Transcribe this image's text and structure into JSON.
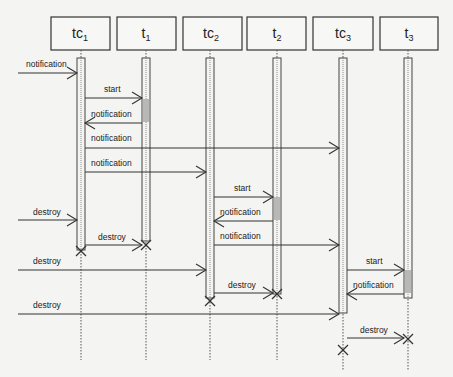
{
  "diagram": {
    "type": "sequence",
    "participants": [
      {
        "id": "tc1",
        "base": "tc",
        "sub": "1",
        "x": 81
      },
      {
        "id": "t1",
        "base": "t",
        "sub": "1",
        "x": 146
      },
      {
        "id": "tc2",
        "base": "tc",
        "sub": "2",
        "x": 210
      },
      {
        "id": "t2",
        "base": "t",
        "sub": "2",
        "x": 277
      },
      {
        "id": "tc3",
        "base": "tc",
        "sub": "3",
        "x": 343
      },
      {
        "id": "t3",
        "base": "t",
        "sub": "3",
        "x": 408
      }
    ],
    "messages": [
      {
        "from": "external",
        "to": "tc1",
        "label": "notification"
      },
      {
        "from": "tc1",
        "to": "t1",
        "label": "start"
      },
      {
        "from": "t1",
        "to": "tc1",
        "label": "notification"
      },
      {
        "from": "tc1",
        "to": "tc3",
        "label": "notification"
      },
      {
        "from": "tc1",
        "to": "tc2",
        "label": "notification"
      },
      {
        "from": "tc2",
        "to": "t2",
        "label": "start"
      },
      {
        "from": "t2",
        "to": "tc2",
        "label": "notification"
      },
      {
        "from": "external",
        "to": "tc1",
        "label": "destroy"
      },
      {
        "from": "tc1",
        "to": "t1",
        "label": "destroy"
      },
      {
        "from": "tc2",
        "to": "tc3",
        "label": "notification"
      },
      {
        "from": "external",
        "to": "tc2",
        "label": "destroy"
      },
      {
        "from": "tc3",
        "to": "t3",
        "label": "start"
      },
      {
        "from": "tc2",
        "to": "t2",
        "label": "destroy"
      },
      {
        "from": "t3",
        "to": "tc3",
        "label": "notification"
      },
      {
        "from": "external",
        "to": "tc3",
        "label": "destroy"
      },
      {
        "from": "tc3",
        "to": "t3",
        "label": "destroy"
      }
    ]
  },
  "labels": {
    "p0": "tc",
    "p0s": "1",
    "p1": "t",
    "p1s": "1",
    "p2": "tc",
    "p2s": "2",
    "p3": "t",
    "p3s": "2",
    "p4": "tc",
    "p4s": "3",
    "p5": "t",
    "p5s": "3",
    "m0": "notification",
    "m1": "start",
    "m2": "notification",
    "m3": "notification",
    "m4": "notification",
    "m5": "start",
    "m6": "notification",
    "m7": "destroy",
    "m8": "destroy",
    "m9": "notification",
    "m10": "destroy",
    "m11": "start",
    "m12": "destroy",
    "m13": "notification",
    "m14": "destroy",
    "m15": "destroy"
  }
}
